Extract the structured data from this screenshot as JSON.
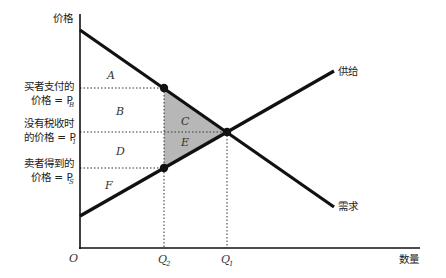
{
  "diagram": {
    "y_axis_label": "价格",
    "x_axis_label": "数量",
    "origin_label": "O",
    "curves": {
      "supply": {
        "label": "供给"
      },
      "demand": {
        "label": "需求"
      }
    },
    "price_labels": {
      "buyer": {
        "line1": "买者支付的",
        "line2": "价格 = P",
        "sub": "B"
      },
      "no_tax": {
        "line1": "没有税收时",
        "line2": "的价格 = P",
        "sub": "1"
      },
      "seller": {
        "line1": "卖者得到的",
        "line2": "价格 = P",
        "sub": "S"
      }
    },
    "quantity_labels": {
      "q2": {
        "main": "Q",
        "sub": "2"
      },
      "q1": {
        "main": "Q",
        "sub": "1"
      }
    },
    "areas": {
      "A": "A",
      "B": "B",
      "C": "C",
      "D": "D",
      "E": "E",
      "F": "F"
    },
    "colors": {
      "line": "#111111",
      "deadweight_loss_fill": "#b7b7b7",
      "background": "#ffffff"
    }
  }
}
